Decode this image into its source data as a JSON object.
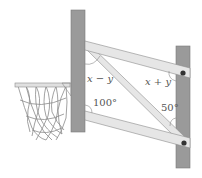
{
  "diagram": {
    "type": "geometry",
    "labels": {
      "angle_top_left": "x − y",
      "angle_top_right": "x + y",
      "angle_bottom_left": "100°",
      "angle_bottom_right": "50°"
    },
    "colors": {
      "post": "#9a9a9a",
      "post_edge": "#7a7a7a",
      "bar": "#e6e6e6",
      "bar_edge": "#8c8c8c",
      "bolt": "#333333",
      "net": "#777777",
      "rim": "#d0d0d0",
      "arc": "#888888",
      "text": "#555555"
    }
  }
}
